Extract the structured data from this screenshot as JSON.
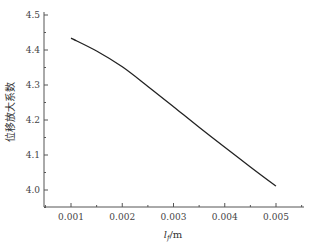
{
  "chart_data": {
    "type": "line",
    "title": "",
    "xlabel": "l_f/m",
    "xlabel_main": "l",
    "xlabel_sub": "f",
    "xlabel_unit": "/m",
    "ylabel": "位移放大系数",
    "xlim": [
      0.00055,
      0.0055
    ],
    "ylim": [
      3.95,
      4.5
    ],
    "x_ticks": [
      "0.001",
      "0.002",
      "0.003",
      "0.004",
      "0.005"
    ],
    "x_tick_values": [
      0.001,
      0.002,
      0.003,
      0.004,
      0.005
    ],
    "y_ticks": [
      "4.0",
      "4.1",
      "4.2",
      "4.3",
      "4.4",
      "4.5"
    ],
    "y_tick_values": [
      4.0,
      4.1,
      4.2,
      4.3,
      4.4,
      4.5
    ],
    "grid": false,
    "legend": null,
    "series": [
      {
        "name": "位移放大系数",
        "color": "#222222",
        "x": [
          0.001,
          0.0015,
          0.002,
          0.0025,
          0.003,
          0.0035,
          0.004,
          0.0045,
          0.005
        ],
        "values": [
          4.434,
          4.397,
          4.352,
          4.296,
          4.238,
          4.179,
          4.122,
          4.066,
          4.011
        ]
      }
    ]
  }
}
